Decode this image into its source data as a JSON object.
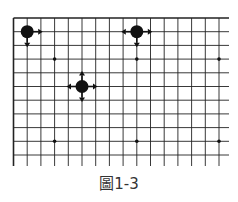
{
  "figure": {
    "caption": "圖1-3",
    "board": {
      "line_color": "#222222",
      "stone_color": "#111111",
      "columns_visible": 16,
      "rows_visible": 11,
      "grid_spacing_px": 13.7
    },
    "stones": [
      {
        "col": 1,
        "row": 1,
        "arrows": [
          "right",
          "down"
        ]
      },
      {
        "col": 9,
        "row": 1,
        "arrows": [
          "left",
          "right",
          "down"
        ]
      },
      {
        "col": 5,
        "row": 5,
        "arrows": [
          "up",
          "down",
          "left",
          "right"
        ]
      }
    ],
    "star_points": [
      {
        "col": 3,
        "row": 3
      },
      {
        "col": 9,
        "row": 3
      },
      {
        "col": 15,
        "row": 3
      },
      {
        "col": 3,
        "row": 9
      },
      {
        "col": 9,
        "row": 9
      },
      {
        "col": 15,
        "row": 9
      }
    ]
  }
}
